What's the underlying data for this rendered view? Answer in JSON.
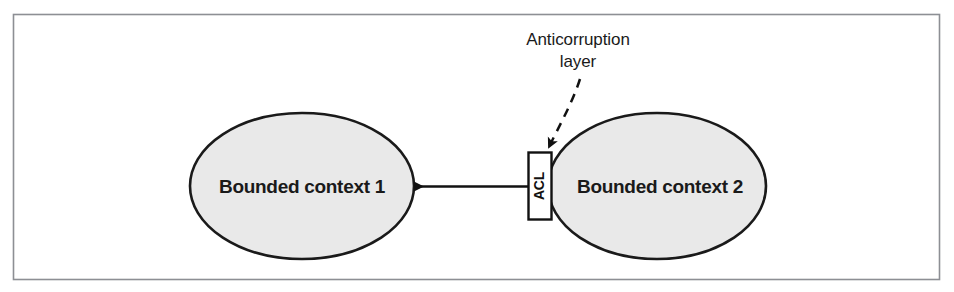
{
  "figure": {
    "frame": {
      "border_color": "#8d8f94",
      "background": "#ffffff"
    },
    "nodes": [
      {
        "id": "bounded-context-1",
        "label": "Bounded context 1",
        "shape": "ellipse",
        "fill": "#e9e9e9",
        "stroke": "#1a1a1a",
        "cx": 302,
        "cy": 186,
        "rx": 112,
        "ry": 73
      },
      {
        "id": "bounded-context-2",
        "label": "Bounded context 2",
        "shape": "ellipse",
        "fill": "#e9e9e9",
        "stroke": "#1a1a1a",
        "cx": 657,
        "cy": 186,
        "rx": 109,
        "ry": 73
      }
    ],
    "acl_box": {
      "label": "ACL",
      "fill": "#ffffff",
      "stroke": "#111111",
      "x": 528,
      "y": 152,
      "width": 23,
      "height": 67,
      "text_orientation": "vertical-bottom-to-top"
    },
    "callout": {
      "lines": [
        "Anticorruption",
        "layer"
      ],
      "color": "#1a1a1a",
      "connector": "dashed-arrow"
    },
    "arrow": {
      "id": "bc2-to-bc1",
      "direction": "left",
      "style": "solid",
      "color": "#111111",
      "from_x": 528,
      "to_x": 412,
      "y": 186
    }
  }
}
